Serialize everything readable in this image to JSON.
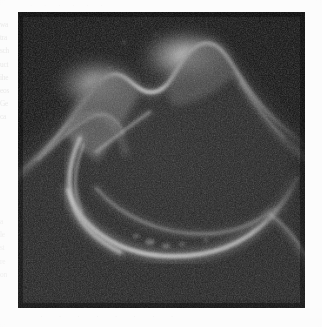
{
  "figure": {
    "kind": "scanned-grayscale-micrograph",
    "panel": {
      "background_color": "#0b0b0b",
      "border_color": "#141414",
      "x": 18,
      "y": 12,
      "width": 287,
      "height": 296
    },
    "page_background_color": "#fcfcfc"
  },
  "ghost_text": {
    "note": "Illegible bleed-through from the reverse of the scanned page, rendered as faint grey marks.",
    "left_margin_lines": [
      "wa",
      "tra",
      "sch",
      "uct",
      "ihe",
      "eos",
      "Ge",
      "ca"
    ],
    "left_margin_lower_lines": [
      "a",
      "le",
      "st",
      "re",
      "on"
    ],
    "bottom_strip": "· · · · · · · ·",
    "top_strip": "· · · · · ·"
  },
  "structures": {
    "hump_left": {
      "label": "left rounded ridge hump",
      "peak_x": 95,
      "peak_y": 82,
      "brightness": "#c9c9c9"
    },
    "hump_right": {
      "label": "right rounded ridge hump",
      "peak_x": 185,
      "peak_y": 52,
      "brightness": "#d8d8d8"
    },
    "crescent_arc": {
      "label": "bright U-shaped crescent arc",
      "left_x": 70,
      "top_y": 150,
      "bottom_y": 228,
      "right_x": 250,
      "brightness": "#d0d0d0"
    },
    "inner_arc": {
      "label": "secondary inner arc band",
      "brightness": "#8d8d8d"
    },
    "diagonal_streak": {
      "label": "thin diagonal streak",
      "start_x": 100,
      "start_y": 148,
      "end_x": 150,
      "end_y": 112,
      "brightness": "#9a9a9a"
    },
    "left_flank": {
      "label": "left descending flank ridge",
      "brightness": "#7c7c7c"
    },
    "right_flank": {
      "label": "right descending flank ridge",
      "brightness": "#909090"
    },
    "lower_right_spur": {
      "label": "lower right spur ridge",
      "brightness": "#8a8a8a"
    }
  }
}
